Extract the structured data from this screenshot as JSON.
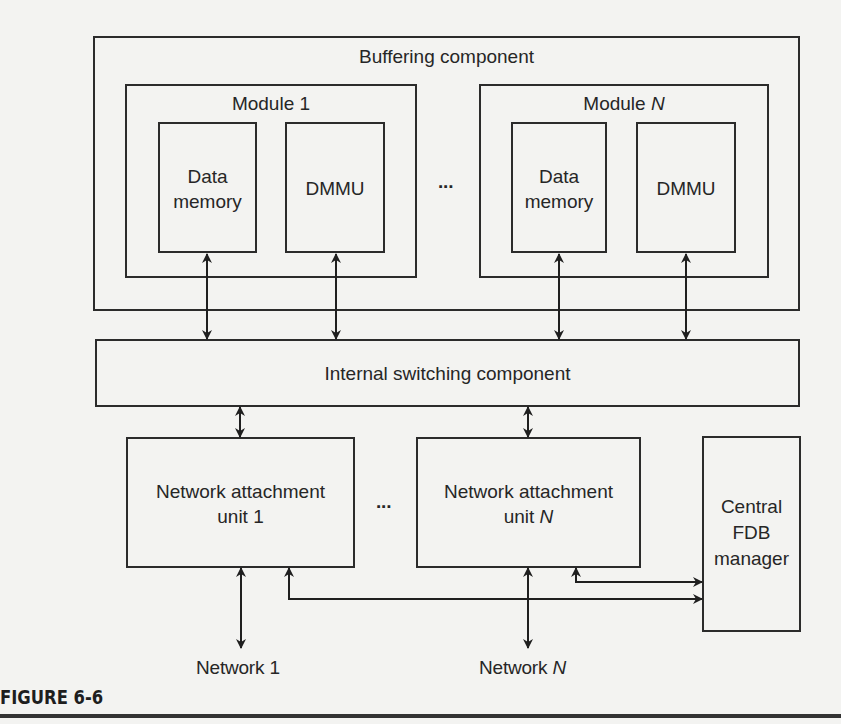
{
  "figure": {
    "caption": "FIGURE 6-6"
  },
  "buffering": {
    "label": "Buffering component",
    "ellipsis": "...",
    "modules": [
      {
        "label_prefix": "Module ",
        "label_index": "1",
        "data_memory_line1": "Data",
        "data_memory_line2": "memory",
        "dmmu": "DMMU"
      },
      {
        "label_prefix": "Module ",
        "label_index": "N",
        "data_memory_line1": "Data",
        "data_memory_line2": "memory",
        "dmmu": "DMMU"
      }
    ]
  },
  "switching": {
    "label": "Internal switching component"
  },
  "attachment_units": {
    "ellipsis": "...",
    "units": [
      {
        "line1": "Network attachment",
        "line2_prefix": "unit ",
        "line2_index": "1"
      },
      {
        "line1": "Network attachment",
        "line2_prefix": "unit ",
        "line2_index": "N"
      }
    ]
  },
  "fdb": {
    "line1": "Central",
    "line2": "FDB",
    "line3": "manager"
  },
  "networks": [
    {
      "prefix": "Network ",
      "index": "1"
    },
    {
      "prefix": "Network ",
      "index": "N"
    }
  ],
  "colors": {
    "background": "#f3f3f1",
    "line": "#2b2b2b",
    "text": "#262626"
  }
}
